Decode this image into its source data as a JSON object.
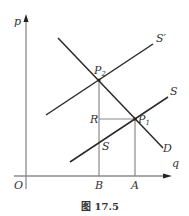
{
  "figure": {
    "caption": "图 17.5",
    "axes": {
      "y_label": "p",
      "x_label": "q",
      "origin_label": "O"
    },
    "curves": [
      {
        "id": "D",
        "label": "D",
        "type": "demand"
      },
      {
        "id": "S",
        "label": "S",
        "type": "supply"
      },
      {
        "id": "S_prime",
        "label": "S′",
        "type": "supply-shifted"
      }
    ],
    "points": [
      {
        "id": "P1",
        "label": "P",
        "subscript": "1"
      },
      {
        "id": "P2",
        "label": "P",
        "subscript": "2"
      },
      {
        "id": "S_point",
        "label": "S"
      }
    ],
    "axis_marks": {
      "x": [
        "B",
        "A"
      ],
      "y": [
        "R"
      ]
    },
    "colors": {
      "curve": "#2a2a2a",
      "guide": "#8a8a8a",
      "axis": "#8a8a8a",
      "text": "#333333"
    }
  }
}
